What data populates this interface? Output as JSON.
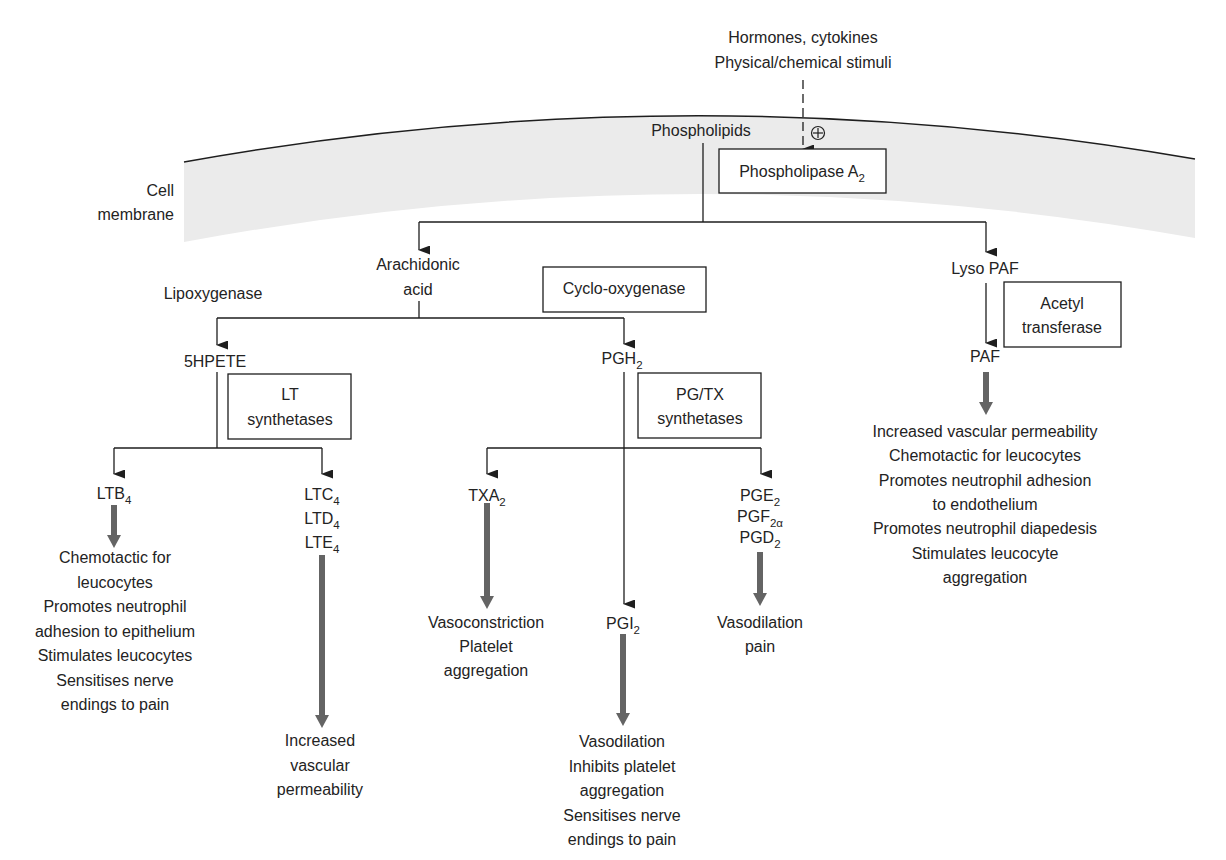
{
  "stimuli": {
    "line1": "Hormones, cytokines",
    "line2": "Physical/chemical stimuli",
    "activation_icon": "plus-circle-icon"
  },
  "membrane_label": {
    "line1": "Cell",
    "line2": "membrane"
  },
  "nodes": {
    "phospholipids": "Phospholipids",
    "phospholipase": {
      "main": "Phospholipase A",
      "sub": "2"
    },
    "arachidonic_acid": {
      "line1": "Arachidonic",
      "line2": "acid"
    },
    "lyso_paf": "Lyso PAF",
    "lipoxygenase": "Lipoxygenase",
    "cyclooxygenase": "Cyclo-oxygenase",
    "hpete": "5HPETE",
    "pgh2": {
      "main": "PGH",
      "sub": "2"
    },
    "lt_synthetases": {
      "line1": "LT",
      "line2": "synthetases"
    },
    "pgtx_synthetases": {
      "line1": "PG/TX",
      "line2": "synthetases"
    },
    "acetyl_transferase": {
      "line1": "Acetyl",
      "line2": "transferase"
    },
    "paf": "PAF",
    "ltb4": {
      "main": "LTB",
      "sub": "4"
    },
    "ltc4": {
      "main": "LTC",
      "sub": "4"
    },
    "ltd4": {
      "main": "LTD",
      "sub": "4"
    },
    "lte4": {
      "main": "LTE",
      "sub": "4"
    },
    "txa2": {
      "main": "TXA",
      "sub": "2"
    },
    "pge2": {
      "main": "PGE",
      "sub": "2"
    },
    "pgf2a": {
      "main": "PGF",
      "sub": "2α"
    },
    "pgd2": {
      "main": "PGD",
      "sub": "2"
    },
    "pgi2": {
      "main": "PGI",
      "sub": "2"
    }
  },
  "effects": {
    "ltb4": [
      "Chemotactic for",
      "leucocytes",
      "Promotes neutrophil",
      "adhesion to epithelium",
      "Stimulates leucocytes",
      "Sensitises nerve",
      "endings to pain"
    ],
    "ltc_d_e": [
      "Increased",
      "vascular",
      "permeability"
    ],
    "txa2": [
      "Vasoconstriction",
      "Platelet",
      "aggregation"
    ],
    "pge_pgf_pgd": [
      "Vasodilation",
      "pain"
    ],
    "pgi2": [
      "Vasodilation",
      "Inhibits platelet",
      "aggregation",
      "Sensitises nerve",
      "endings to pain"
    ],
    "paf": [
      "Increased vascular permeability",
      "Chemotactic for leucocytes",
      "Promotes neutrophil adhesion",
      "to endothelium",
      "Promotes neutrophil diapedesis",
      "Stimulates leucocyte",
      "aggregation"
    ]
  },
  "colors": {
    "membrane_fill": "#ebebeb",
    "line": "#1e1e1e",
    "effect_arrow": "#646464",
    "text": "#232323"
  }
}
